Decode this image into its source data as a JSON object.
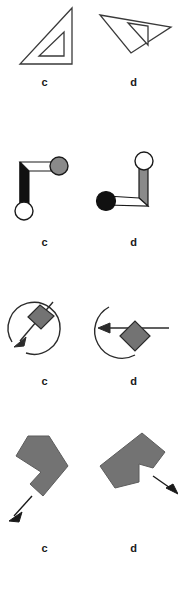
{
  "page": {
    "background_color": "#ffffff",
    "width": 178,
    "height": 601
  },
  "colors": {
    "stroke": "#3a3a3a",
    "stroke_dark": "#1a1a1a",
    "fill_gray": "#737373",
    "fill_gray_light": "#8a8a8a",
    "fill_black": "#111111",
    "fill_white": "#ffffff",
    "label_color": "#1a1a1a"
  },
  "rows": [
    {
      "id": "row-1",
      "name": "set-square-triangles",
      "items": [
        {
          "id": "1c",
          "label": "c",
          "shape": "right-triangle-outline-upright"
        },
        {
          "id": "1d",
          "label": "d",
          "shape": "right-triangle-outline-rotated"
        }
      ]
    },
    {
      "id": "row-2",
      "name": "elbow-arm-with-end-circles",
      "items": [
        {
          "id": "2c",
          "label": "c",
          "shape": "elbow-arm-gray-ball-right-white-ball-bottom"
        },
        {
          "id": "2d",
          "label": "d",
          "shape": "elbow-arm-white-ball-top-black-ball-left"
        }
      ]
    },
    {
      "id": "row-3",
      "name": "circle-with-arrow-and-diamond",
      "items": [
        {
          "id": "3c",
          "label": "c",
          "shape": "open-circle-diagonal-arrow-with-diamond"
        },
        {
          "id": "3d",
          "label": "d",
          "shape": "open-circle-horizontal-arrow-with-diamond"
        }
      ]
    },
    {
      "id": "row-4",
      "name": "gray-chevron-blocks-with-arrow",
      "items": [
        {
          "id": "4c",
          "label": "c",
          "shape": "gray-notched-block-arrow-lower-left"
        },
        {
          "id": "4d",
          "label": "d",
          "shape": "gray-notched-block-arrow-lower-right"
        }
      ]
    }
  ]
}
